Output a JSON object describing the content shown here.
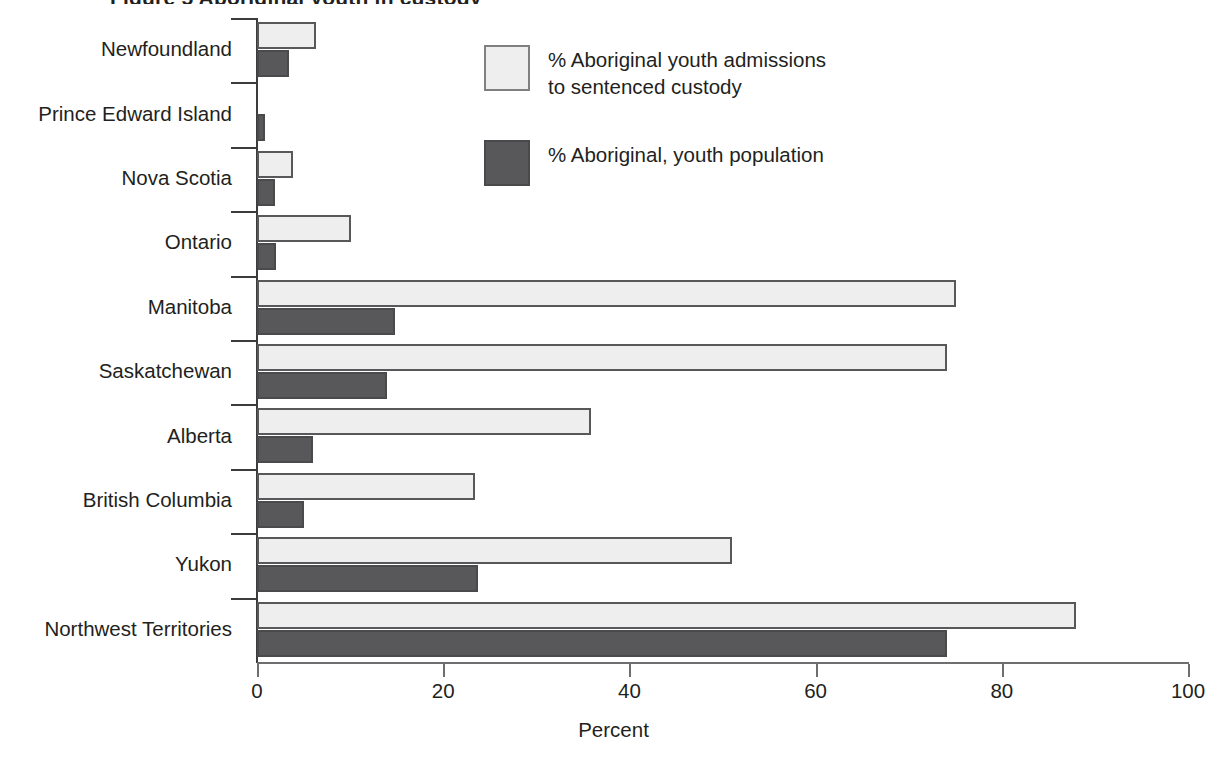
{
  "title": "Figure 5  Aboriginal youth in custody",
  "axis": {
    "x_title": "Percent",
    "x_ticks": [
      "0",
      "20",
      "40",
      "60",
      "80",
      "100"
    ],
    "x_min": 0,
    "x_max": 100
  },
  "legend": {
    "items": [
      {
        "label": "% Aboriginal youth admissions\nto sentenced custody",
        "swatch": "light",
        "color": "#eeeeee"
      },
      {
        "label": "% Aboriginal, youth population",
        "swatch": "dark",
        "color": "#58585a"
      }
    ]
  },
  "chart_data": {
    "type": "bar",
    "orientation": "horizontal",
    "title": "",
    "xlabel": "Percent",
    "ylabel": "",
    "xlim": [
      0,
      100
    ],
    "grid": false,
    "legend_position": "inside-upper-right",
    "categories": [
      "Newfoundland",
      "Prince Edward Island",
      "Nova Scotia",
      "Ontario",
      "Manitoba",
      "Saskatchewan",
      "Alberta",
      "British Columbia",
      "Yukon",
      "Northwest Territories"
    ],
    "series": [
      {
        "name": "% Aboriginal youth admissions to sentenced custody",
        "color": "#eeeeee",
        "values": [
          6.3,
          0,
          3.9,
          10.1,
          75.1,
          74.1,
          35.9,
          23.4,
          51.0,
          88.0
        ]
      },
      {
        "name": "% Aboriginal, youth population",
        "color": "#58585a",
        "values": [
          3.4,
          0.9,
          1.9,
          2.0,
          14.8,
          14.0,
          6.0,
          5.1,
          23.7,
          74.1
        ]
      }
    ]
  }
}
